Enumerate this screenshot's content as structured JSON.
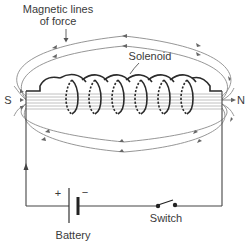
{
  "diagram": {
    "labels": {
      "field_lines": [
        "Magnetic lines",
        "of force"
      ],
      "solenoid": "Solenoid",
      "south_pole": "S",
      "north_pole": "N",
      "battery": "Battery",
      "switch": "Switch",
      "battery_positive": "+",
      "battery_negative": "−"
    },
    "components": {
      "coil_turns": 6,
      "core_field_lines": 6,
      "outer_field_loops": 2,
      "bottom_field_loops": 2
    },
    "colors": {
      "field_line": "#8a8a8a",
      "wire": "#444444",
      "coil": "#2a2a2a",
      "text": "#3a3a3a"
    }
  }
}
